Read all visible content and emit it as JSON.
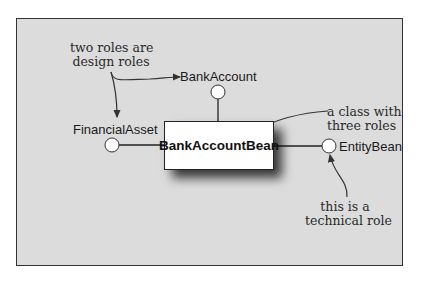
{
  "diagram": {
    "type": "uml-role-interfaces",
    "class": {
      "name": "BankAccountBean"
    },
    "roles": [
      {
        "name": "BankAccount",
        "position": "top",
        "kind": "design"
      },
      {
        "name": "FinancialAsset",
        "position": "left",
        "kind": "design"
      },
      {
        "name": "EntityBean",
        "position": "right",
        "kind": "technical"
      }
    ],
    "annotations": {
      "design_roles": {
        "line1": "two roles are",
        "line2": "design roles"
      },
      "class_roles": {
        "line1": "a class with",
        "line2": "three roles"
      },
      "technical_role": {
        "line1": "this is a",
        "line2": "technical role"
      }
    },
    "colors": {
      "background": "#dcdcdc",
      "frame_border": "#333333",
      "class_fill": "#ffffff",
      "line": "#222222"
    }
  }
}
